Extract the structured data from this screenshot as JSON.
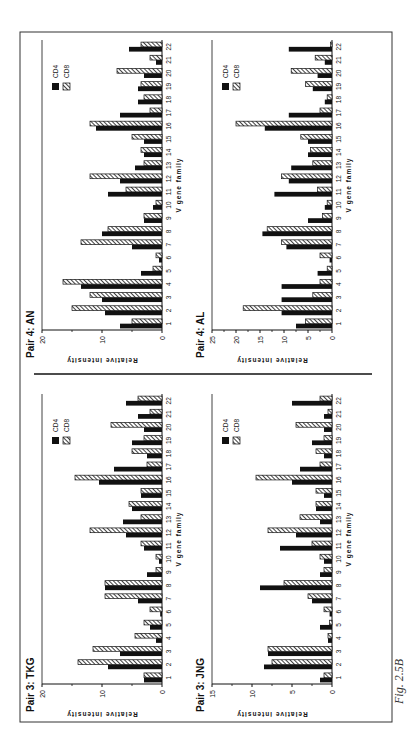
{
  "figure": {
    "caption": "Fig. 2.5B",
    "legend": [
      "CD4",
      "CD8"
    ],
    "xlabel": "V gene family",
    "ylabel": "Relative intensity"
  },
  "chart_data": [
    {
      "type": "bar",
      "title": "Pair 4: AN",
      "xlabel": "V gene family",
      "ylabel": "Relative intensity",
      "ylim": [
        0,
        20
      ],
      "yticks": [
        0,
        10,
        20
      ],
      "categories": [
        "1",
        "2",
        "3",
        "4",
        "5",
        "6",
        "7",
        "8",
        "9",
        "10",
        "11",
        "12",
        "13",
        "14",
        "15",
        "16",
        "17",
        "18",
        "19",
        "20",
        "21",
        "22"
      ],
      "series": [
        {
          "name": "CD4",
          "values": [
            7,
            9.5,
            10,
            13.5,
            3.5,
            0.5,
            5,
            10,
            3,
            1.5,
            9,
            7,
            4.5,
            3,
            3,
            11,
            7,
            4,
            4,
            3,
            1,
            5.5
          ]
        },
        {
          "name": "CD8",
          "values": [
            5,
            15,
            12,
            16.5,
            1.5,
            1,
            13.5,
            9,
            3,
            1,
            6,
            12,
            3,
            3.5,
            5,
            12,
            2,
            3,
            3.5,
            7.5,
            2,
            3.5
          ]
        }
      ],
      "legend": "top-right"
    },
    {
      "type": "bar",
      "title": "Pair 4: AL",
      "xlabel": "V gene family",
      "ylabel": "Relative intensity",
      "ylim": [
        0,
        25
      ],
      "yticks": [
        0,
        5,
        10,
        15,
        20,
        25
      ],
      "categories": [
        "1",
        "2",
        "3",
        "4",
        "5",
        "6",
        "7",
        "8",
        "9",
        "10",
        "11",
        "12",
        "13",
        "14",
        "15",
        "16",
        "17",
        "18",
        "19",
        "20",
        "21",
        "22"
      ],
      "series": [
        {
          "name": "CD4",
          "values": [
            7.5,
            10.5,
            10.5,
            10.5,
            3,
            0.5,
            9.5,
            14.5,
            5,
            1.5,
            12,
            9,
            8.5,
            5,
            5,
            14,
            9,
            1.5,
            4,
            3,
            1.5,
            9
          ]
        },
        {
          "name": "CD8",
          "values": [
            5.5,
            18.5,
            4,
            2.5,
            1,
            2.5,
            10.5,
            13.5,
            2,
            1,
            3,
            10.5,
            4,
            4.5,
            6.5,
            20,
            2.5,
            1,
            5.5,
            8.5,
            3.5,
            0.3
          ]
        }
      ],
      "legend": "top-right"
    },
    {
      "type": "bar",
      "title": "Pair 3: TKG",
      "xlabel": "V gene family",
      "ylabel": "Relative intensity",
      "ylim": [
        0,
        20
      ],
      "yticks": [
        0,
        10,
        20
      ],
      "categories": [
        "1",
        "2",
        "3",
        "4",
        "5",
        "6",
        "7",
        "8",
        "9",
        "10",
        "11",
        "12",
        "13",
        "14",
        "15",
        "16",
        "17",
        "18",
        "19",
        "20",
        "21",
        "22"
      ],
      "series": [
        {
          "name": "CD4",
          "values": [
            3,
            9,
            7,
            1,
            2,
            0.3,
            4,
            9.5,
            2.5,
            0.5,
            3,
            6,
            6.5,
            5,
            3.5,
            10.5,
            8,
            2.5,
            5,
            3,
            4,
            6
          ]
        },
        {
          "name": "CD8",
          "values": [
            3,
            14,
            11.5,
            4.5,
            3,
            2,
            9.5,
            9.5,
            1,
            1,
            3.5,
            12,
            3.5,
            5.5,
            3.5,
            14.5,
            2.5,
            5,
            3,
            8.5,
            2,
            4
          ]
        }
      ],
      "legend": "top-right"
    },
    {
      "type": "bar",
      "title": "Pair 3: JNG",
      "xlabel": "V gene family",
      "ylabel": "Relative intensity",
      "ylim": [
        0,
        15
      ],
      "yticks": [
        0,
        5,
        10,
        15
      ],
      "categories": [
        "1",
        "2",
        "3",
        "4",
        "5",
        "6",
        "7",
        "8",
        "9",
        "10",
        "11",
        "12",
        "13",
        "14",
        "15",
        "16",
        "17",
        "18",
        "19",
        "20",
        "21",
        "22"
      ],
      "series": [
        {
          "name": "CD4",
          "values": [
            1.5,
            8.5,
            8,
            0.5,
            1.5,
            0.3,
            2.5,
            9,
            1.5,
            1,
            6.5,
            4.5,
            1.5,
            2,
            1,
            5,
            4,
            1,
            2.5,
            1,
            1,
            5
          ]
        },
        {
          "name": "CD8",
          "values": [
            1,
            7.5,
            8,
            0.5,
            0.3,
            1,
            3,
            6,
            1,
            1.5,
            2.5,
            8,
            4,
            2,
            2,
            9.5,
            1.5,
            2,
            1,
            4.5,
            0.5,
            1.5
          ]
        }
      ],
      "legend": "top-right"
    }
  ]
}
